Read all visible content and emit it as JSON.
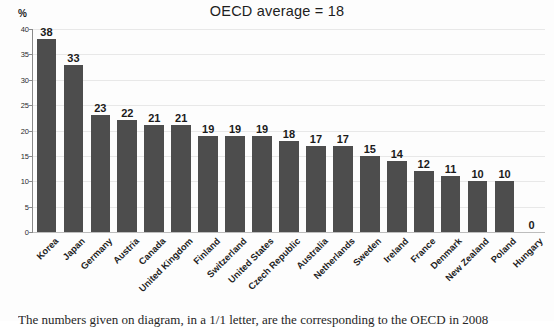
{
  "chart_data": {
    "type": "bar",
    "title": "OECD average = 18",
    "xlabel": "",
    "ylabel": "%",
    "ylim": [
      0,
      40
    ],
    "yticks": [
      0,
      5,
      10,
      15,
      20,
      25,
      30,
      35,
      40
    ],
    "grid": true,
    "legend": "none",
    "bar_color": "#4d4d4d",
    "categories": [
      "Korea",
      "Japan",
      "Germany",
      "Austria",
      "Canada",
      "United Kingdom",
      "Finland",
      "Switzerland",
      "United States",
      "Czech Republic",
      "Australia",
      "Netherlands",
      "Sweden",
      "Ireland",
      "France",
      "Denmark",
      "New Zealand",
      "Poland",
      "Hungary"
    ],
    "values": [
      38,
      33,
      23,
      22,
      21,
      21,
      19,
      19,
      19,
      18,
      17,
      17,
      15,
      14,
      12,
      11,
      10,
      10,
      0
    ],
    "data_labels": [
      "38",
      "33",
      "23",
      "22",
      "21",
      "21",
      "19",
      "19",
      "19",
      "18",
      "17",
      "17",
      "15",
      "14",
      "12",
      "11",
      "10",
      "10",
      "0"
    ]
  },
  "caption": {
    "text": "The numbers given on diagram, in a 1/1 letter, are the corresponding to the OECD in 2008"
  }
}
